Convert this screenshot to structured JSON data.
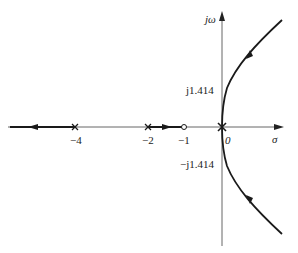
{
  "diagram": {
    "type": "root-locus",
    "axes": {
      "real_label": "σ",
      "imag_label": "jω"
    },
    "tick_labels": {
      "minus4": "−4",
      "minus2": "−2",
      "minus1": "−1",
      "zero": "0",
      "j_pos": "j1.414",
      "j_neg": "−j1.414"
    },
    "poles": [
      0,
      -2,
      -4
    ],
    "zeros": [
      -1
    ],
    "jw_crossings": [
      "j1.414",
      "−j1.414"
    ],
    "colors": {
      "axis": "#555555",
      "locus": "#1a1a1a"
    }
  }
}
